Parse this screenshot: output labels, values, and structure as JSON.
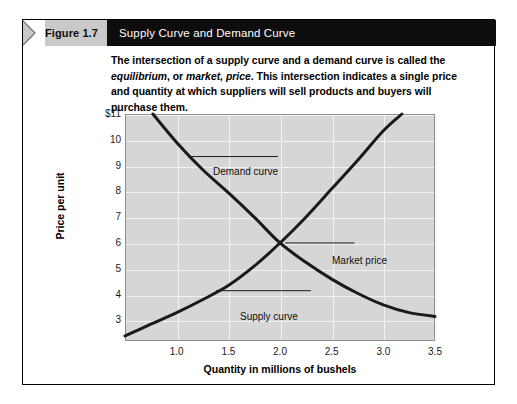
{
  "figure": {
    "tab_label": "Figure 1.7",
    "title": "Supply Curve and Demand Curve",
    "caption_part1": "The intersection of a supply curve and a demand curve is called the ",
    "caption_em1": "equilibrium",
    "caption_part2": ", or ",
    "caption_em2": "market, price",
    "caption_part3": ". This intersection indicates a single price and quantity at which suppliers will sell products and buyers will purchase them.",
    "tab_bg": "#c9c9c9",
    "header_bg": "#0d0d0d",
    "title_color": "#ffffff"
  },
  "chart_data": {
    "type": "line",
    "title": "Supply Curve and Demand Curve",
    "xlabel": "Quantity in millions of bushels",
    "ylabel": "Price per unit",
    "xlim": [
      0.5,
      3.5
    ],
    "ylim": [
      2.2,
      11.0
    ],
    "xticks": [
      "1.0",
      "1.5",
      "2.0",
      "2.5",
      "3.0",
      "3.5"
    ],
    "xtick_values": [
      1.0,
      1.5,
      2.0,
      2.5,
      3.0,
      3.5
    ],
    "yticks": [
      "$11",
      "10",
      "9",
      "8",
      "7",
      "6",
      "5",
      "4",
      "3"
    ],
    "ytick_values": [
      11,
      10,
      9,
      8,
      7,
      6,
      5,
      4,
      3
    ],
    "grid": true,
    "plot_bg": "#d6d6d6",
    "gridline_color": "#f2f2f2",
    "curve_color": "#1a1a1a",
    "legend": "none",
    "series": [
      {
        "name": "Demand curve",
        "points": [
          [
            0.77,
            11.0
          ],
          [
            1.0,
            9.9
          ],
          [
            1.25,
            8.85
          ],
          [
            1.5,
            7.95
          ],
          [
            1.75,
            7.0
          ],
          [
            2.0,
            6.0
          ],
          [
            2.25,
            5.25
          ],
          [
            2.5,
            4.6
          ],
          [
            2.75,
            4.05
          ],
          [
            3.0,
            3.6
          ],
          [
            3.25,
            3.3
          ],
          [
            3.5,
            3.15
          ]
        ]
      },
      {
        "name": "Supply curve",
        "points": [
          [
            0.5,
            2.4
          ],
          [
            0.75,
            2.85
          ],
          [
            1.0,
            3.3
          ],
          [
            1.25,
            3.8
          ],
          [
            1.5,
            4.35
          ],
          [
            1.75,
            5.1
          ],
          [
            2.0,
            6.0
          ],
          [
            2.25,
            7.0
          ],
          [
            2.5,
            8.1
          ],
          [
            2.75,
            9.2
          ],
          [
            3.0,
            10.35
          ],
          [
            3.18,
            11.0
          ]
        ]
      }
    ],
    "annotations": [
      {
        "label": "Demand curve",
        "point_x": 1.13,
        "point_y": 9.35
      },
      {
        "label": "Market price",
        "point_x": 2.0,
        "point_y": 6.0
      },
      {
        "label": "Supply curve",
        "point_x": 1.38,
        "point_y": 4.15
      }
    ]
  }
}
